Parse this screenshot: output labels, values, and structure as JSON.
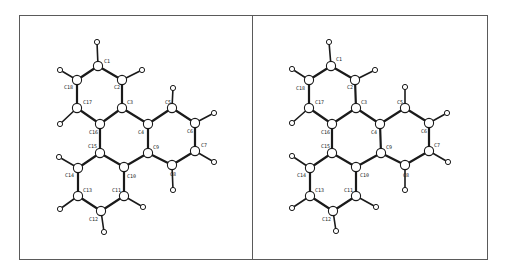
{
  "figure": {
    "type": "stereo-pair molecular structure",
    "molecule_atoms_count": {
      "C": 18,
      "H": 12
    },
    "frames": [
      {
        "name": "left-view",
        "x": 19,
        "y": 15,
        "w": 233,
        "h": 244
      },
      {
        "name": "right-view",
        "x": 252,
        "y": 15,
        "w": 235,
        "h": 244
      }
    ]
  },
  "bonds": [
    [
      "C1",
      "C2"
    ],
    [
      "C2",
      "C3"
    ],
    [
      "C3",
      "C16"
    ],
    [
      "C16",
      "C17"
    ],
    [
      "C17",
      "C18"
    ],
    [
      "C18",
      "C1"
    ],
    [
      "C3",
      "C4"
    ],
    [
      "C4",
      "C9"
    ],
    [
      "C9",
      "C10"
    ],
    [
      "C10",
      "C15"
    ],
    [
      "C15",
      "C16"
    ],
    [
      "C4",
      "C5"
    ],
    [
      "C5",
      "C6"
    ],
    [
      "C6",
      "C7"
    ],
    [
      "C7",
      "C8"
    ],
    [
      "C8",
      "C9"
    ],
    [
      "C10",
      "C11"
    ],
    [
      "C11",
      "C12"
    ],
    [
      "C12",
      "C13"
    ],
    [
      "C13",
      "C14"
    ],
    [
      "C14",
      "C15"
    ]
  ],
  "h_bonds": [
    [
      "C1",
      "H1"
    ],
    [
      "C2",
      "H2"
    ],
    [
      "C18",
      "H18"
    ],
    [
      "C17",
      "H17"
    ],
    [
      "C5",
      "H5"
    ],
    [
      "C6",
      "H6"
    ],
    [
      "C7",
      "H7"
    ],
    [
      "C8",
      "H8"
    ],
    [
      "C14",
      "H14"
    ],
    [
      "C13",
      "H13"
    ],
    [
      "C11",
      "H11"
    ],
    [
      "C12",
      "H12"
    ]
  ],
  "views": [
    {
      "name": "left",
      "atoms": {
        "C1": [
          98,
          66
        ],
        "C2": [
          122,
          80
        ],
        "C3": [
          122,
          108
        ],
        "C4": [
          148,
          124
        ],
        "C5": [
          172,
          108
        ],
        "C6": [
          195,
          123
        ],
        "C7": [
          195,
          151
        ],
        "C8": [
          172,
          165
        ],
        "C9": [
          148,
          153
        ],
        "C10": [
          124,
          167
        ],
        "C11": [
          124,
          196
        ],
        "C12": [
          101,
          211
        ],
        "C13": [
          78,
          196
        ],
        "C14": [
          78,
          168
        ],
        "C15": [
          100,
          153
        ],
        "C16": [
          100,
          124
        ],
        "C17": [
          77,
          108
        ],
        "C18": [
          77,
          80
        ],
        "H1": [
          97,
          42
        ],
        "H2": [
          142,
          70
        ],
        "H18": [
          60,
          70
        ],
        "H17": [
          60,
          124
        ],
        "H5": [
          173,
          88
        ],
        "H6": [
          214,
          113
        ],
        "H7": [
          214,
          162
        ],
        "H8": [
          173,
          190
        ],
        "H14": [
          59,
          157
        ],
        "H13": [
          60,
          209
        ],
        "H11": [
          143,
          207
        ],
        "H12": [
          104,
          232
        ]
      },
      "labels": [
        {
          "text": "C1",
          "x": 104,
          "y": 63
        },
        {
          "text": "C2",
          "x": 114,
          "y": 89
        },
        {
          "text": "C18",
          "x": 64,
          "y": 89
        },
        {
          "text": "C17",
          "x": 83,
          "y": 104
        },
        {
          "text": "C3",
          "x": 127,
          "y": 104
        },
        {
          "text": "C16",
          "x": 89,
          "y": 134
        },
        {
          "text": "C4",
          "x": 138,
          "y": 134
        },
        {
          "text": "C5",
          "x": 165,
          "y": 104
        },
        {
          "text": "C6",
          "x": 187,
          "y": 133
        },
        {
          "text": "C7",
          "x": 201,
          "y": 147
        },
        {
          "text": "C9",
          "x": 153,
          "y": 149
        },
        {
          "text": "C15",
          "x": 88,
          "y": 148
        },
        {
          "text": "C8",
          "x": 170,
          "y": 176
        },
        {
          "text": "C10",
          "x": 127,
          "y": 178
        },
        {
          "text": "C14",
          "x": 65,
          "y": 177
        },
        {
          "text": "C13",
          "x": 83,
          "y": 192
        },
        {
          "text": "C11",
          "x": 112,
          "y": 192
        },
        {
          "text": "C12",
          "x": 89,
          "y": 221
        }
      ]
    },
    {
      "name": "right",
      "atoms": {
        "C1": [
          331,
          66
        ],
        "C2": [
          355,
          80
        ],
        "C3": [
          356,
          108
        ],
        "C4": [
          380,
          124
        ],
        "C5": [
          405,
          108
        ],
        "C6": [
          429,
          123
        ],
        "C7": [
          429,
          151
        ],
        "C8": [
          405,
          165
        ],
        "C9": [
          381,
          153
        ],
        "C10": [
          356,
          167
        ],
        "C11": [
          356,
          196
        ],
        "C12": [
          333,
          211
        ],
        "C13": [
          310,
          196
        ],
        "C14": [
          310,
          168
        ],
        "C15": [
          332,
          153
        ],
        "C16": [
          332,
          124
        ],
        "C17": [
          309,
          108
        ],
        "C18": [
          309,
          80
        ],
        "H1": [
          329,
          42
        ],
        "H2": [
          375,
          70
        ],
        "H18": [
          292,
          69
        ],
        "H17": [
          292,
          123
        ],
        "H5": [
          405,
          87
        ],
        "H6": [
          447,
          113
        ],
        "H7": [
          448,
          162
        ],
        "H8": [
          405,
          190
        ],
        "H14": [
          292,
          156
        ],
        "H13": [
          292,
          208
        ],
        "H11": [
          376,
          207
        ],
        "H12": [
          336,
          231
        ]
      },
      "labels": [
        {
          "text": "C1",
          "x": 336,
          "y": 61
        },
        {
          "text": "C2",
          "x": 347,
          "y": 89
        },
        {
          "text": "C18",
          "x": 296,
          "y": 90
        },
        {
          "text": "C17",
          "x": 315,
          "y": 104
        },
        {
          "text": "C3",
          "x": 361,
          "y": 104
        },
        {
          "text": "C16",
          "x": 321,
          "y": 134
        },
        {
          "text": "C4",
          "x": 371,
          "y": 134
        },
        {
          "text": "C5",
          "x": 397,
          "y": 104
        },
        {
          "text": "C6",
          "x": 421,
          "y": 133
        },
        {
          "text": "C7",
          "x": 434,
          "y": 147
        },
        {
          "text": "C9",
          "x": 386,
          "y": 149
        },
        {
          "text": "C15",
          "x": 321,
          "y": 148
        },
        {
          "text": "C8",
          "x": 403,
          "y": 177
        },
        {
          "text": "C10",
          "x": 360,
          "y": 177
        },
        {
          "text": "C14",
          "x": 297,
          "y": 177
        },
        {
          "text": "C13",
          "x": 315,
          "y": 192
        },
        {
          "text": "C11",
          "x": 344,
          "y": 192
        },
        {
          "text": "C12",
          "x": 322,
          "y": 221
        }
      ]
    }
  ]
}
